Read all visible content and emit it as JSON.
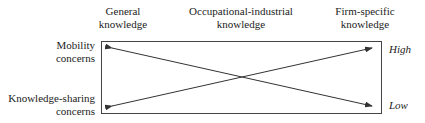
{
  "columns": [
    {
      "line1": "General",
      "line2": "knowledge"
    },
    {
      "line1": "Occupational-industrial",
      "line2": "knowledge"
    },
    {
      "line1": "Firm-specific",
      "line2": "knowledge"
    }
  ],
  "rows": [
    {
      "line1": "Mobility",
      "line2": "concerns"
    },
    {
      "line1": "Knowledge-sharing",
      "line2": "concerns"
    }
  ],
  "scale": {
    "high": "High",
    "low": "Low"
  },
  "arrows": [
    {
      "from": "top-left",
      "to": "bottom-right",
      "meaning": "Mobility concerns high for general knowledge, low for firm-specific"
    },
    {
      "from": "bottom-left",
      "to": "top-right",
      "meaning": "Knowledge-sharing concerns low for general knowledge, high for firm-specific"
    }
  ],
  "colors": {
    "line": "#333333",
    "text": "#222222"
  }
}
